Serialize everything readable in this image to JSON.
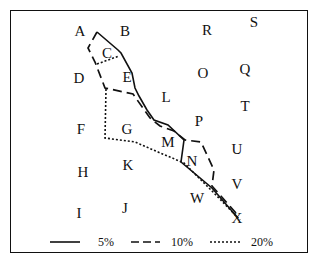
{
  "diagram": {
    "type": "contour-map",
    "region_labels": [
      {
        "id": "A",
        "x": 80,
        "y": 31
      },
      {
        "id": "B",
        "x": 125,
        "y": 31
      },
      {
        "id": "R",
        "x": 207,
        "y": 30
      },
      {
        "id": "S",
        "x": 254,
        "y": 22
      },
      {
        "id": "C",
        "x": 107,
        "y": 53
      },
      {
        "id": "D",
        "x": 79,
        "y": 78
      },
      {
        "id": "E",
        "x": 127,
        "y": 77
      },
      {
        "id": "O",
        "x": 203,
        "y": 73
      },
      {
        "id": "Q",
        "x": 245,
        "y": 69
      },
      {
        "id": "L",
        "x": 166,
        "y": 97
      },
      {
        "id": "T",
        "x": 245,
        "y": 106
      },
      {
        "id": "F",
        "x": 81,
        "y": 129
      },
      {
        "id": "G",
        "x": 127,
        "y": 129
      },
      {
        "id": "P",
        "x": 199,
        "y": 121
      },
      {
        "id": "M",
        "x": 168,
        "y": 142
      },
      {
        "id": "U",
        "x": 237,
        "y": 149
      },
      {
        "id": "N",
        "x": 192,
        "y": 161
      },
      {
        "id": "K",
        "x": 128,
        "y": 165
      },
      {
        "id": "H",
        "x": 83,
        "y": 172
      },
      {
        "id": "V",
        "x": 237,
        "y": 184
      },
      {
        "id": "W",
        "x": 197,
        "y": 198
      },
      {
        "id": "I",
        "x": 79,
        "y": 213
      },
      {
        "id": "J",
        "x": 125,
        "y": 208
      },
      {
        "id": "X",
        "x": 237,
        "y": 218
      }
    ],
    "contours": [
      {
        "name": "5%",
        "style": "solid",
        "points": "97,32 118,50 121,53 132,73 135,88 139,96 147,110 154,120 168,125 184,140 181,162 212,188 238,218"
      },
      {
        "name": "10%",
        "style": "dashed",
        "points": "97,32 88,48 95,62 105,88 133,94 150,118 160,126 174,131 185,140 201,142 214,170 212,186 236,213"
      },
      {
        "name": "20%",
        "style": "dotted",
        "points": "106,89 105,138 135,142 158,152 184,163 214,193 240,220"
      },
      {
        "name": "20%-divider",
        "style": "dotted",
        "points": "97,64 119,56"
      }
    ],
    "legend": [
      {
        "label": "5%",
        "style": "solid"
      },
      {
        "label": "10%",
        "style": "dashed"
      },
      {
        "label": "20%",
        "style": "dotted"
      }
    ],
    "colors": {
      "ink": "#111111",
      "background": "#ffffff"
    }
  }
}
